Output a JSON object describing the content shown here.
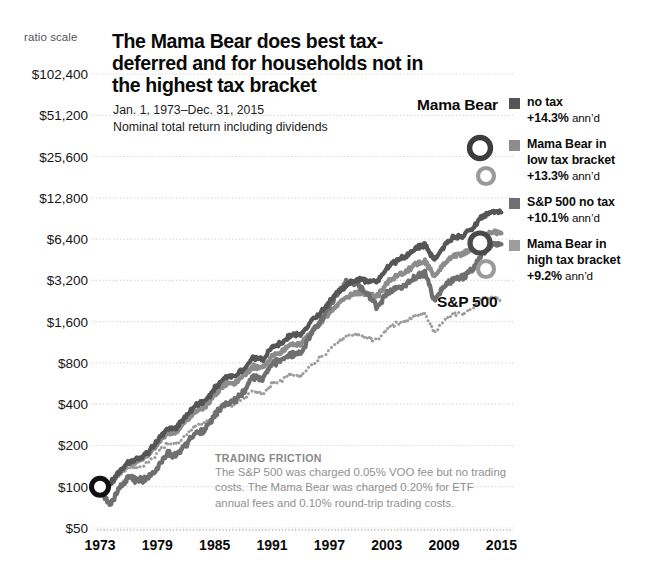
{
  "header": {
    "ratio_scale_label": "ratio scale",
    "title": "The Mama Bear does best tax-deferred and for households not in the highest tax bracket",
    "subtitle_line1": "Jan. 1, 1973–Dec. 31, 2015",
    "subtitle_line2": "Nominal total return including dividends"
  },
  "series_tags": {
    "mama_bear": "Mama Bear",
    "sp500": "S&P 500"
  },
  "legend": {
    "items": [
      {
        "swatch_color": "#555555",
        "line1": "no tax",
        "value": "+14.3%",
        "suffix": "ann’d",
        "line2": ""
      },
      {
        "swatch_color": "#8c8c8c",
        "line1": "Mama Bear in",
        "line2": "low tax bracket",
        "value": "+13.3%",
        "suffix": "ann’d"
      },
      {
        "swatch_color": "#6f6f6f",
        "line1": "S&P 500 no tax",
        "line2": "",
        "value": "+10.1%",
        "suffix": "ann’d"
      },
      {
        "swatch_color": "#9d9d9d",
        "line1": "Mama Bear in",
        "line2": "high tax bracket",
        "value": "+9.2%",
        "suffix": "ann’d"
      }
    ]
  },
  "footnote": {
    "heading": "TRADING FRICTION",
    "body": "The S&P 500 was charged 0.05% VOO fee but no trading costs. The Mama Bear was charged 0.20% for ETF annual fees and 0.10% round-trip trading costs."
  },
  "chart_data": {
    "type": "line",
    "title": "The Mama Bear does best tax-deferred and for households not in the highest tax bracket",
    "subtitle": "Jan. 1, 1973–Dec. 31, 2015 — Nominal total return including dividends",
    "xlabel": "",
    "ylabel": "",
    "yscale": "log",
    "yscale_note": "ratio scale",
    "grid": true,
    "legend_position": "right",
    "xlim": [
      1973,
      2016
    ],
    "ylim": [
      50,
      102400
    ],
    "xticks": [
      1973,
      1979,
      1985,
      1991,
      1997,
      2003,
      2009,
      2015
    ],
    "yticks": [
      50,
      100,
      200,
      400,
      800,
      1600,
      3200,
      6400,
      12800,
      25600,
      51200,
      102400
    ],
    "ytick_labels": [
      "$50",
      "$100",
      "$200",
      "$400",
      "$800",
      "$1,600",
      "$3,200",
      "$6,400",
      "$12,800",
      "$25,600",
      "$51,200",
      "$102,400"
    ],
    "start_value": 100,
    "x": [
      1973,
      1974,
      1975,
      1976,
      1977,
      1978,
      1979,
      1980,
      1981,
      1982,
      1983,
      1984,
      1985,
      1986,
      1987,
      1988,
      1989,
      1990,
      1991,
      1992,
      1993,
      1994,
      1995,
      1996,
      1997,
      1998,
      1999,
      2000,
      2001,
      2002,
      2003,
      2004,
      2005,
      2006,
      2007,
      2008,
      2009,
      2010,
      2011,
      2012,
      2013,
      2014,
      2015
    ],
    "series": [
      {
        "name": "Mama Bear no tax",
        "annualized": "+14.3%",
        "color": "#555555",
        "style": "solid",
        "final_value": 32000,
        "values": [
          100,
          104,
          128,
          152,
          160,
          176,
          215,
          262,
          270,
          330,
          390,
          420,
          520,
          620,
          640,
          720,
          860,
          845,
          1040,
          1120,
          1290,
          1280,
          1590,
          1850,
          2250,
          2650,
          3050,
          3250,
          3180,
          3100,
          3900,
          4450,
          4800,
          5500,
          5800,
          4500,
          5700,
          6600,
          6800,
          7700,
          9400,
          10100,
          10000
        ]
      },
      {
        "name": "Mama Bear in low tax bracket",
        "annualized": "+13.3%",
        "color": "#8c8c8c",
        "style": "solid",
        "final_value": 24000,
        "values": [
          100,
          103,
          125,
          147,
          154,
          168,
          204,
          246,
          252,
          305,
          358,
          383,
          470,
          556,
          570,
          636,
          754,
          735,
          898,
          960,
          1098,
          1082,
          1334,
          1540,
          1860,
          2170,
          2480,
          2620,
          2540,
          2460,
          3060,
          3460,
          3700,
          4200,
          4390,
          3380,
          4240,
          4870,
          4980,
          5580,
          6740,
          7180,
          7050
        ]
      },
      {
        "name": "S&P 500 no tax",
        "annualized": "+10.1%",
        "color": "#6f6f6f",
        "style": "solid",
        "final_value": 6400,
        "values": [
          100,
          72,
          98,
          120,
          110,
          116,
          136,
          178,
          168,
          202,
          246,
          258,
          338,
          398,
          418,
          484,
          634,
          610,
          792,
          848,
          930,
          940,
          1290,
          1580,
          2100,
          2690,
          3240,
          2940,
          2580,
          2000,
          2570,
          2840,
          2970,
          3430,
          3610,
          2270,
          2860,
          3280,
          3340,
          3860,
          5100,
          5790,
          5860
        ]
      },
      {
        "name": "Mama Bear in high tax bracket",
        "annualized": "+9.2%",
        "color": "#9d9d9d",
        "style": "dotted",
        "final_value": 4400,
        "values": [
          100,
          101,
          119,
          136,
          140,
          149,
          176,
          206,
          206,
          242,
          277,
          288,
          344,
          396,
          398,
          433,
          501,
          478,
          568,
          595,
          663,
          636,
          764,
          858,
          1008,
          1144,
          1270,
          1306,
          1230,
          1160,
          1404,
          1542,
          1604,
          1770,
          1800,
          1350,
          1646,
          1840,
          1830,
          1996,
          2340,
          2420,
          2310
        ]
      }
    ],
    "annotations": [
      {
        "text": "Mama Bear",
        "x": 2009,
        "y": 45000
      },
      {
        "text": "S&P 500",
        "x": 2010,
        "y": 2700
      },
      {
        "text": "TRADING FRICTION",
        "x": 1988,
        "y": 260
      }
    ]
  }
}
